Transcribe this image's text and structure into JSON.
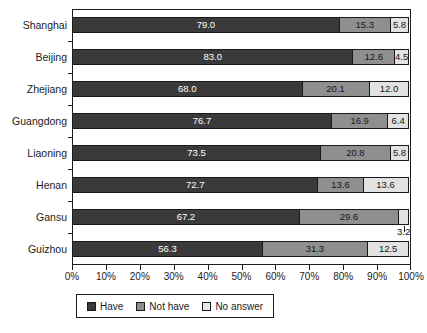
{
  "chart_data": {
    "type": "bar",
    "subtype": "horizontal-100-percent-stacked",
    "title": "",
    "xlabel": "",
    "ylabel": "",
    "xlim": [
      0,
      100
    ],
    "xticks": [
      "0%",
      "10%",
      "20%",
      "30%",
      "40%",
      "50%",
      "60%",
      "70%",
      "80%",
      "90%",
      "100%"
    ],
    "grid": false,
    "legend_position": "bottom-left",
    "categories": [
      "Shanghai",
      "Beijing",
      "Zhejiang",
      "Guangdong",
      "Liaoning",
      "Henan",
      "Gansu",
      "Guizhou"
    ],
    "series": [
      {
        "name": "Have",
        "color": "#3a3a3a",
        "values": [
          79.0,
          83.0,
          68.0,
          76.7,
          73.5,
          72.7,
          67.2,
          56.3
        ],
        "labels": [
          "79.0",
          "83.0",
          "68.0",
          "76.7",
          "73.5",
          "72.7",
          "67.2",
          "56.3"
        ]
      },
      {
        "name": "Not have",
        "color": "#8f8f8f",
        "values": [
          15.3,
          12.6,
          20.1,
          16.9,
          20.8,
          13.6,
          29.6,
          31.3
        ],
        "labels": [
          "15.3",
          "12.6",
          "20.1",
          "16.9",
          "20.8",
          "13.6",
          "29.6",
          "31.3"
        ]
      },
      {
        "name": "No answer",
        "color": "#e2e2e2",
        "values": [
          5.8,
          4.5,
          12.0,
          6.4,
          5.8,
          13.6,
          3.2,
          12.5
        ],
        "labels": [
          "5.8",
          "4.5",
          "12.0",
          "6.4",
          "5.8",
          "13.6",
          "3.2",
          "12.5"
        ],
        "label_outside": [
          false,
          false,
          false,
          false,
          false,
          false,
          true,
          false
        ]
      }
    ]
  },
  "legend": {
    "items": [
      {
        "label": "Have",
        "color": "#3a3a3a"
      },
      {
        "label": "Not have",
        "color": "#8f8f8f"
      },
      {
        "label": "No answer",
        "color": "#e8e8e8"
      }
    ]
  }
}
